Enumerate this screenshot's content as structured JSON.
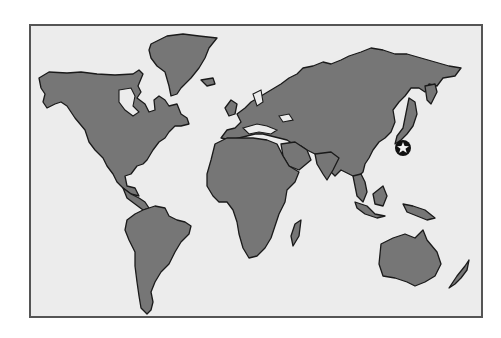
{
  "map": {
    "type": "world-map",
    "projection": "simplified outline",
    "colors": {
      "background": "#ffffff",
      "ocean": "#ececec",
      "land": "#767676",
      "outline": "#1a1a1a",
      "frame": "#555555",
      "marker": "#111111",
      "marker_star": "#f2f2f2"
    },
    "regions": [
      {
        "name": "North America"
      },
      {
        "name": "Greenland"
      },
      {
        "name": "South America"
      },
      {
        "name": "Europe"
      },
      {
        "name": "Africa"
      },
      {
        "name": "Madagascar"
      },
      {
        "name": "Asia"
      },
      {
        "name": "Japan"
      },
      {
        "name": "Southeast Asia"
      },
      {
        "name": "New Guinea"
      },
      {
        "name": "Australia"
      },
      {
        "name": "New Zealand"
      }
    ],
    "markers": [
      {
        "icon": "star-icon",
        "location": "Japan",
        "label": "Japan"
      }
    ]
  }
}
